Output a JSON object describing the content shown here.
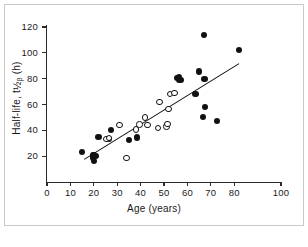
{
  "chart_data": {
    "type": "scatter",
    "title": "",
    "xlabel": "Age (years)",
    "ylabel_text": "Half-life, t",
    "ylabel_sym": "1/2",
    "ylabel_sub": "β",
    "ylabel_unit": "(h)",
    "xlim": [
      0,
      100
    ],
    "ylim": [
      0,
      120
    ],
    "xticks": [
      0,
      10,
      20,
      30,
      40,
      50,
      60,
      70,
      80,
      100
    ],
    "xtick_labels": [
      "0",
      "10",
      "20",
      "30",
      "40",
      "50",
      "60",
      "70",
      "80",
      "100"
    ],
    "yticks": [
      20,
      40,
      60,
      80,
      100,
      120
    ],
    "ytick_labels": [
      "20",
      "40",
      "60",
      "80",
      "100",
      "120"
    ],
    "grid": false,
    "legend": "none",
    "marker_colors": {
      "filled": "#111111",
      "open_edge": "#111111",
      "open_face": "#ffffff"
    },
    "series": [
      {
        "name": "filled-circles",
        "marker": "filled-circle",
        "points": [
          [
            15,
            23.5
          ],
          [
            19.5,
            20.5
          ],
          [
            19.8,
            19.0
          ],
          [
            20.2,
            21.0
          ],
          [
            20.0,
            16.5
          ],
          [
            21.0,
            20.0
          ],
          [
            22.0,
            35.0
          ],
          [
            26.5,
            33.0
          ],
          [
            27.5,
            40.0
          ],
          [
            35.0,
            32.5
          ],
          [
            38.5,
            34.5
          ],
          [
            55.5,
            80.5
          ],
          [
            56.3,
            81.0
          ],
          [
            56.5,
            79.0
          ],
          [
            57.2,
            79.0
          ],
          [
            63.5,
            68.0
          ],
          [
            64.8,
            85.5
          ],
          [
            67.0,
            114.0
          ],
          [
            67.3,
            79.5
          ],
          [
            66.8,
            50.5
          ],
          [
            67.5,
            58.0
          ],
          [
            72.8,
            47.0
          ],
          [
            82.0,
            102.5
          ]
        ]
      },
      {
        "name": "open-circles",
        "marker": "open-circle",
        "points": [
          [
            25.5,
            33.5
          ],
          [
            26.5,
            34.0
          ],
          [
            31.0,
            44.0
          ],
          [
            34.0,
            18.5
          ],
          [
            38.0,
            40.5
          ],
          [
            39.5,
            44.5
          ],
          [
            42.0,
            50.0
          ],
          [
            43.0,
            44.0
          ],
          [
            47.5,
            42.0
          ],
          [
            48.0,
            62.0
          ],
          [
            51.0,
            43.0
          ],
          [
            51.5,
            45.0
          ],
          [
            52.0,
            56.5
          ],
          [
            52.5,
            68.0
          ],
          [
            54.5,
            69.0
          ]
        ]
      }
    ],
    "fit_line": {
      "name": "regression-line",
      "x1": 16,
      "y1": 18,
      "x2": 82,
      "y2": 92
    }
  }
}
